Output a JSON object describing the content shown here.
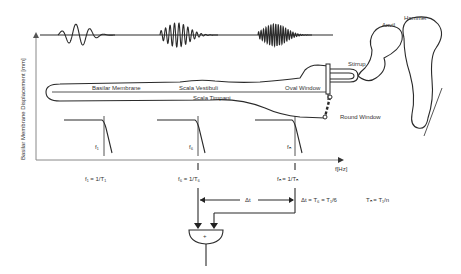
{
  "diagram": {
    "y_axis_label": "Basilar Membrane Displacement [mm]",
    "x_axis_label": "f[Hz]",
    "cochlea": {
      "basilar_membrane": "Basilar Membrane",
      "scala_vestibuli": "Scala Vestibuli",
      "scala_timpani": "Scala Timpani",
      "oval_window": "Oval Window",
      "round_window": "Round Window"
    },
    "ossicles": {
      "stirrup": "Stirrup",
      "anvil": "Anvil",
      "hammer": "Hammer"
    },
    "filters": [
      {
        "label": "f₁",
        "equation": "f₁ = 1/T₁"
      },
      {
        "label": "f₆",
        "equation": "f₆ = 1/T₆"
      },
      {
        "label": "fₙ",
        "equation": "fₙ = 1/Tₙ"
      }
    ],
    "delay_label": "Δt",
    "delay_equation": "Δt = T₆ = T₁/6",
    "period_equation": "Tₙ = T₁/n",
    "summer_symbol": "+"
  }
}
